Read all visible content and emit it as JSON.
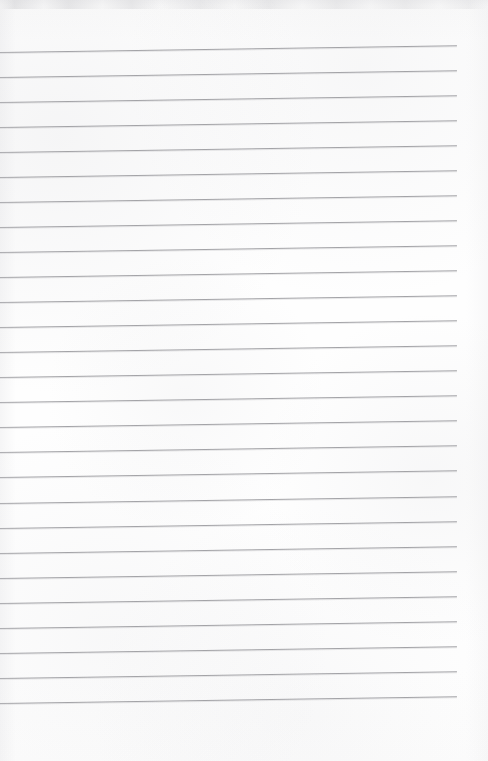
{
  "document": {
    "kind": "scanned-ruled-notebook-page",
    "title": "Blank lined paper",
    "content_text": "",
    "handwriting": "none",
    "page_width": 488,
    "page_height": 761
  },
  "paper": {
    "background_color": "#fdfdfd",
    "top_band_color": "#f4f4f5",
    "texture": "scanner-noise"
  },
  "ruling": {
    "line_color": "#9c9ca0",
    "line_thickness_px": 1,
    "line_count": 27,
    "line_spacing_px": 25.0,
    "first_line_y_px": 52,
    "last_line_y_px": 703,
    "line_start_x_px": 0,
    "line_end_x_px": 457,
    "right_margin_px": 31,
    "skew_degrees": -0.85,
    "margin_rule": "none",
    "description": "Horizontal ruled lines running full bleed from the left edge, stopping short of the right edge, tilted very slightly upward toward the right from the scan."
  },
  "lines": [
    {
      "index": 1,
      "y": 52,
      "label": "ruled-line-1"
    },
    {
      "index": 2,
      "y": 77,
      "label": "ruled-line-2"
    },
    {
      "index": 3,
      "y": 102,
      "label": "ruled-line-3"
    },
    {
      "index": 4,
      "y": 127,
      "label": "ruled-line-4"
    },
    {
      "index": 5,
      "y": 152,
      "label": "ruled-line-5"
    },
    {
      "index": 6,
      "y": 177,
      "label": "ruled-line-6"
    },
    {
      "index": 7,
      "y": 202,
      "label": "ruled-line-7"
    },
    {
      "index": 8,
      "y": 227,
      "label": "ruled-line-8"
    },
    {
      "index": 9,
      "y": 252,
      "label": "ruled-line-9"
    },
    {
      "index": 10,
      "y": 277,
      "label": "ruled-line-10"
    },
    {
      "index": 11,
      "y": 302,
      "label": "ruled-line-11"
    },
    {
      "index": 12,
      "y": 327,
      "label": "ruled-line-12"
    },
    {
      "index": 13,
      "y": 352,
      "label": "ruled-line-13"
    },
    {
      "index": 14,
      "y": 377,
      "label": "ruled-line-14"
    },
    {
      "index": 15,
      "y": 402,
      "label": "ruled-line-15"
    },
    {
      "index": 16,
      "y": 427,
      "label": "ruled-line-16"
    },
    {
      "index": 17,
      "y": 452,
      "label": "ruled-line-17"
    },
    {
      "index": 18,
      "y": 477,
      "label": "ruled-line-18"
    },
    {
      "index": 19,
      "y": 503,
      "label": "ruled-line-19"
    },
    {
      "index": 20,
      "y": 528,
      "label": "ruled-line-20"
    },
    {
      "index": 21,
      "y": 553,
      "label": "ruled-line-21"
    },
    {
      "index": 22,
      "y": 578,
      "label": "ruled-line-22"
    },
    {
      "index": 23,
      "y": 603,
      "label": "ruled-line-23"
    },
    {
      "index": 24,
      "y": 628,
      "label": "ruled-line-24"
    },
    {
      "index": 25,
      "y": 653,
      "label": "ruled-line-25"
    },
    {
      "index": 26,
      "y": 678,
      "label": "ruled-line-26"
    },
    {
      "index": 27,
      "y": 703,
      "label": "ruled-line-27"
    }
  ]
}
